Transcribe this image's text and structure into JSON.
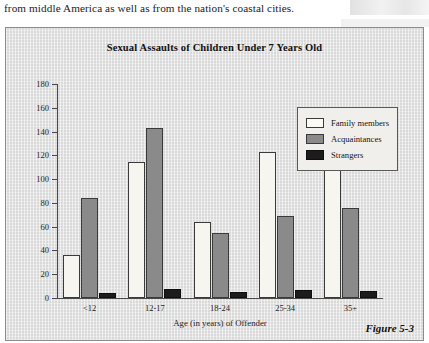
{
  "page": {
    "body_text": "from middle America as well as from the nation's coastal cities.",
    "figure_caption": "Figure 5-3"
  },
  "chart_data": {
    "type": "bar",
    "title": "Sexual Assaults of Children Under 7 Years Old",
    "xlabel": "Age (in years) of Offender",
    "ylabel": "",
    "categories": [
      "<12",
      "12-17",
      "18-24",
      "25-34",
      "35+"
    ],
    "series": [
      {
        "name": "Family members",
        "color": "#f7f5f0",
        "values": [
          36,
          114,
          64,
          123,
          113
        ]
      },
      {
        "name": "Acquaintances",
        "color": "#8a8a8a",
        "values": [
          84,
          143,
          55,
          69,
          76
        ]
      },
      {
        "name": "Strangers",
        "color": "#1c1c1c",
        "values": [
          4,
          8,
          5,
          7,
          6
        ]
      }
    ],
    "ylim": [
      0,
      180
    ],
    "yticks": [
      0,
      20,
      40,
      60,
      80,
      100,
      120,
      140,
      160,
      180
    ],
    "ytick_labels": [
      "0",
      "20",
      "40",
      "60",
      "80",
      "100",
      "120",
      "140",
      "160",
      "180"
    ],
    "grid": false,
    "legend_position": "top-right",
    "plot_background": "#d9d9d9"
  }
}
